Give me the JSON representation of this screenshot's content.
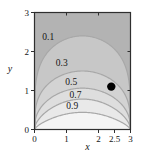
{
  "figure": {
    "background": "#ffffff",
    "frame_color": "#2f2f2f",
    "text_color": "#151515"
  },
  "chart_data": {
    "type": "contour",
    "title": "",
    "xlabel": "x",
    "ylabel": "y",
    "xlim": [
      0,
      3
    ],
    "ylim": [
      0,
      3
    ],
    "grid": false,
    "x_ticks": [
      {
        "value": 0,
        "label": "0"
      },
      {
        "value": 1,
        "label": "1"
      },
      {
        "value": 2,
        "label": "2"
      },
      {
        "value": 2.5,
        "label": "2.5"
      },
      {
        "value": 3,
        "label": "3"
      }
    ],
    "y_ticks": [
      {
        "value": 0,
        "label": "0"
      },
      {
        "value": 1,
        "label": "1"
      },
      {
        "value": 2,
        "label": "2"
      },
      {
        "value": 3,
        "label": "3"
      }
    ],
    "mirror_ticks_top": [
      1,
      2
    ],
    "mirror_ticks_right": [
      1,
      2
    ],
    "outer_fill": "#b3b3b3",
    "contour_line_color": "#a8a8a8",
    "contours": [
      {
        "level": 0.1,
        "label": "0.1",
        "peak_y": 2.4,
        "shape_exp": 0.22,
        "band_fill": "#c7c7c7",
        "label_x": 0.43,
        "label_y": 2.37
      },
      {
        "level": 0.3,
        "label": "0.3",
        "peak_y": 1.5,
        "shape_exp": 0.3,
        "band_fill": "#d3d3d3",
        "label_x": 0.85,
        "label_y": 1.72
      },
      {
        "level": 0.5,
        "label": "0.5",
        "peak_y": 1.06,
        "shape_exp": 0.4,
        "band_fill": "#dedede",
        "label_x": 1.15,
        "label_y": 1.22
      },
      {
        "level": 0.7,
        "label": "0.7",
        "peak_y": 0.78,
        "shape_exp": 0.55,
        "band_fill": "#e9e9e9",
        "label_x": 1.28,
        "label_y": 0.9
      },
      {
        "level": 0.9,
        "label": "0.9",
        "peak_y": 0.44,
        "shape_exp": 0.7,
        "band_fill": "#f4f4f4",
        "label_x": 1.18,
        "label_y": 0.6
      }
    ],
    "marker": {
      "x": 2.4,
      "y": 1.1,
      "color": "#000000",
      "radius_px": 4.2
    }
  }
}
